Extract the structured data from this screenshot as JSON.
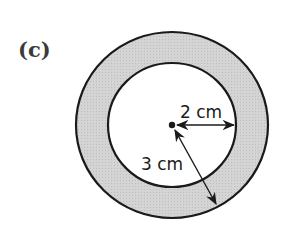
{
  "figure": {
    "part_label": "(c)",
    "shape": "annulus",
    "colors": {
      "ring_fill": "#d2d2d2",
      "stroke": "#1a1a1a",
      "inner_fill": "#ffffff"
    },
    "inner_radius_label": "2 cm",
    "outer_radius_label": "3 cm"
  }
}
